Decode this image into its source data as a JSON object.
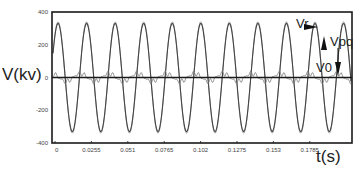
{
  "chart_data": {
    "type": "line",
    "title": "",
    "xlabel": "t(s)",
    "ylabel": "V(kv)",
    "xlim": [
      0,
      0.2
    ],
    "ylim": [
      -400,
      400
    ],
    "x_ticks": [
      "0",
      "0.0255",
      "0.051",
      "0.0765",
      "0.102",
      "0.1275",
      "0.153",
      "0.1785"
    ],
    "y_ticks": [
      "400",
      "200",
      "0",
      "-200",
      "-400"
    ],
    "grid": false,
    "series": [
      {
        "name": "Vr",
        "description": "source/reference voltage sinusoid",
        "amplitude_kv": 330,
        "frequency_hz": 50,
        "cycles_shown": 9
      },
      {
        "name": "Vpq",
        "description": "injected series voltage (small, distorted)",
        "amplitude_kv": 25
      },
      {
        "name": "V0",
        "description": "load voltage sinusoid",
        "amplitude_kv": 340,
        "frequency_hz": 50
      }
    ],
    "annotations": [
      {
        "text": "Vr",
        "x": 0.18,
        "y": 300,
        "arrow": "left"
      },
      {
        "text": "Vpq",
        "x": 0.19,
        "y": 180,
        "arrow": "up/down"
      },
      {
        "text": "V0",
        "x": 0.185,
        "y": 60,
        "arrow": "none"
      }
    ]
  },
  "axes": {
    "ylabel": "V(kv)",
    "xlabel": "t(s)",
    "y_ticks": [
      "400",
      "200",
      "0",
      "-200",
      "-400"
    ],
    "x_ticks": [
      "0",
      "0.0255",
      "0.051",
      "0.0765",
      "0.102",
      "0.1275",
      "0.153",
      "0.1785"
    ]
  },
  "annotations": {
    "vr": "Vr",
    "vpq": "Vpq",
    "v0": "V0"
  },
  "colors": {
    "axis": "#1a1a1a",
    "main_wave": "#444444",
    "ghost_wave": "#9a9a9a",
    "distorted": "#777777"
  }
}
